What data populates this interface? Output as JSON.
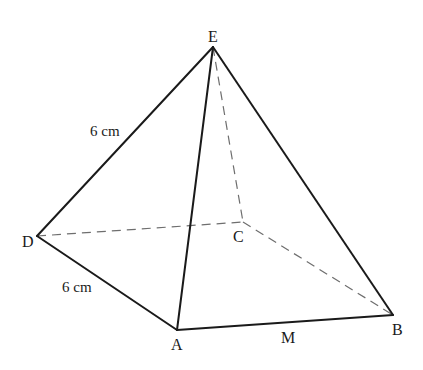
{
  "figure": {
    "type": "square-based pyramid",
    "background": "#ffffff",
    "line_color": "#1a1a1a",
    "hidden_line_color": "#6e6e6e",
    "vertices": {
      "E": {
        "label": "E",
        "x": 213,
        "y": 47
      },
      "D": {
        "label": "D",
        "x": 37,
        "y": 236
      },
      "C": {
        "label": "C",
        "x": 243,
        "y": 222
      },
      "A": {
        "label": "A",
        "x": 177,
        "y": 330
      },
      "B": {
        "label": "B",
        "x": 393,
        "y": 315
      }
    },
    "solid_edges": [
      [
        "E",
        "D"
      ],
      [
        "E",
        "A"
      ],
      [
        "E",
        "B"
      ],
      [
        "D",
        "A"
      ],
      [
        "A",
        "B"
      ]
    ],
    "hidden_edges": [
      [
        "E",
        "C"
      ],
      [
        "D",
        "C"
      ],
      [
        "C",
        "B"
      ]
    ],
    "labels": {
      "E": "E",
      "D": "D",
      "C": "C",
      "A": "A",
      "B": "B",
      "M": "M",
      "edge_ED": "6 cm",
      "edge_DA": "6 cm"
    }
  }
}
